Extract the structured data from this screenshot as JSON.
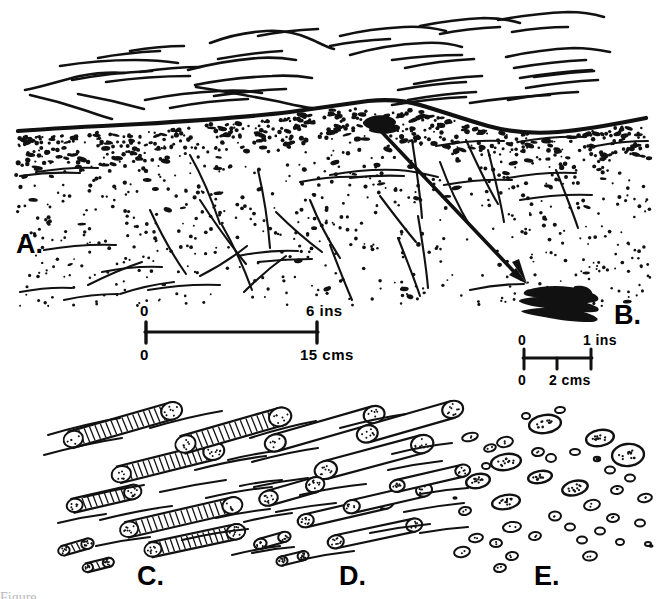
{
  "figure": {
    "background_color": "#ffffff",
    "ink_color": "#111111",
    "width": 665,
    "height": 599
  },
  "panels": [
    {
      "id": "A",
      "label": "A.",
      "label_x": 16,
      "label_y": 253,
      "description": "Vertical section through laminated sediment overlying burrowed stippled sandy unit with fractures"
    },
    {
      "id": "B",
      "label": "B.",
      "label_x": 614,
      "label_y": 324,
      "description": "Close-up of dark specimen indicated by arrow from panel A"
    },
    {
      "id": "C",
      "label": "C.",
      "label_x": 137,
      "label_y": 585,
      "description": "Bedding plane view: hairpin / U-shaped spreiten burrows with stippled terminal bulbs"
    },
    {
      "id": "D",
      "label": "D.",
      "label_x": 339,
      "label_y": 585,
      "description": "Bedding plane view: elongate straight tube burrows with stippled ends"
    },
    {
      "id": "E",
      "label": "E.",
      "label_x": 534,
      "label_y": 585,
      "description": "Bedding plane view: scattered oval burrow cross-sections"
    }
  ],
  "scale_bars": [
    {
      "id": "scale-a",
      "x_start": 145,
      "x_end": 318,
      "y": 332,
      "top_left_label": "0",
      "top_right_label": "6 ins",
      "bottom_left_label": "0",
      "bottom_right_label": "15 cms",
      "mid_tick": null
    },
    {
      "id": "scale-b",
      "x_start": 523,
      "x_end": 592,
      "y": 358,
      "top_left_label": "0",
      "top_right_label": "1 ins",
      "bottom_left_label": "0",
      "bottom_right_label": "2 cms",
      "mid_tick": 557
    }
  ],
  "arrow": {
    "id": "detail-arrow",
    "x1": 377,
    "y1": 127,
    "x2": 527,
    "y2": 284,
    "head_size": 13
  },
  "chart_data": {
    "type": "diagram",
    "panel_ids": [
      "A",
      "B",
      "C",
      "D",
      "E"
    ],
    "units_shown": [
      "ins",
      "cms"
    ],
    "scale_values": [
      {
        "panel": "A",
        "inches": 6,
        "centimetres": 15
      },
      {
        "panel": "B",
        "inches": 1,
        "centimetres": 2
      }
    ]
  },
  "caption": {
    "partial_text": "Figure ..."
  }
}
